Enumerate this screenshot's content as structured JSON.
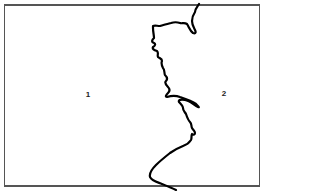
{
  "map": {
    "frame_color": "#555555",
    "boundary_color": "#000000",
    "regions": [
      {
        "id": "region-1",
        "label": "1",
        "x": 88,
        "y": 95
      },
      {
        "id": "region-2",
        "label": "2",
        "x": 224,
        "y": 94
      }
    ]
  }
}
